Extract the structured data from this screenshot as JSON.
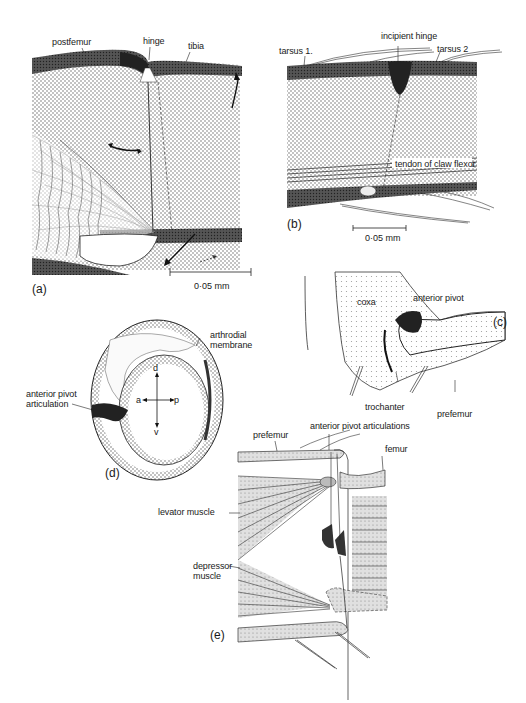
{
  "figure": {
    "panels": {
      "a": {
        "label": "(a)",
        "annotations": {
          "postfemur": "postfemur",
          "hinge": "hinge",
          "tibia": "tibia"
        },
        "scale_bar": "0·05  mm"
      },
      "b": {
        "label": "(b)",
        "annotations": {
          "tarsus1": "tarsus 1.",
          "incipient_hinge": "incipient hinge",
          "tarsus2": "tarsus 2",
          "tendon": "tendon of claw flexor"
        },
        "scale_bar": "0·05  mm"
      },
      "c": {
        "label": "(c)",
        "annotations": {
          "coxa": "coxa",
          "anterior_pivot": "anterior pivot",
          "trochanter": "trochanter",
          "prefemur": "prefemur"
        }
      },
      "d": {
        "label": "(d)",
        "annotations": {
          "arthrodial_membrane": "arthrodial\nmembrane",
          "anterior_pivot_articulation": "anterior pivot\narticulation"
        },
        "axes": {
          "dorsal": "d",
          "ventral": "v",
          "anterior": "a",
          "posterior": "p"
        }
      },
      "e": {
        "label": "(e)",
        "annotations": {
          "prefemur": "prefemur",
          "anterior_pivot_articulations": "anterior pivot articulations",
          "femur": "femur",
          "levator_muscle": "levator muscle",
          "depressor_muscle": "depressor\nmuscle"
        }
      }
    },
    "colors": {
      "ink": "#1a1a1a",
      "stipple": "#9a9a9a",
      "dark_cuticle": "#4a4a4a",
      "paper": "#ffffff"
    }
  }
}
